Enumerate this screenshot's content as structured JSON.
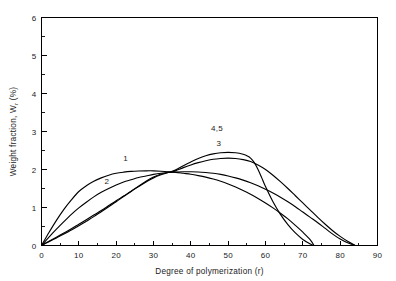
{
  "chart_data": {
    "type": "line",
    "title": "",
    "xlabel": "Degree of polymerization (r)",
    "ylabel_parts": {
      "main": "Weight fraction, W",
      "subscript": "r",
      "units": " (%)"
    },
    "ylabel": "Weight fraction, Wr (%)",
    "xlim": [
      0,
      90
    ],
    "ylim": [
      0,
      6
    ],
    "xticks": [
      0,
      10,
      20,
      30,
      40,
      50,
      60,
      70,
      80,
      90
    ],
    "xtick_labels": [
      "0",
      "10",
      "20",
      "30",
      "40",
      "50",
      "60",
      "70",
      "80",
      "90"
    ],
    "xminor_step": 5,
    "yticks": [
      0,
      1,
      2,
      3,
      4,
      5,
      6
    ],
    "ytick_labels": [
      "0",
      "1",
      "2",
      "3",
      "4",
      "5",
      "6"
    ],
    "yminor_step": 0.5,
    "grid": false,
    "legend_position": "inline-annotations",
    "line_color": "#000000",
    "background_color": "#ffffff",
    "annotations": [
      {
        "text": "1",
        "x": 22.5,
        "y": 2.22
      },
      {
        "text": "2",
        "x": 17.5,
        "y": 1.62
      },
      {
        "text": "3",
        "x": 47.5,
        "y": 2.62
      },
      {
        "text": "4,5",
        "x": 47.0,
        "y": 3.02
      }
    ],
    "series": [
      {
        "name": "1",
        "label": "1",
        "x": [
          0,
          2,
          4,
          6,
          8,
          10,
          12,
          14,
          16,
          18,
          20,
          22,
          24,
          26,
          28,
          30,
          32,
          34,
          35,
          36,
          38,
          40,
          42,
          44,
          46,
          48,
          50,
          52,
          54,
          56,
          58,
          60,
          62,
          64,
          66,
          68,
          70,
          72,
          73
        ],
        "y": [
          0,
          0.34,
          0.66,
          0.95,
          1.2,
          1.42,
          1.57,
          1.69,
          1.78,
          1.85,
          1.9,
          1.93,
          1.95,
          1.96,
          1.965,
          1.965,
          1.955,
          1.94,
          1.93,
          1.925,
          1.9,
          1.875,
          1.84,
          1.8,
          1.75,
          1.69,
          1.62,
          1.54,
          1.45,
          1.35,
          1.24,
          1.12,
          0.99,
          0.85,
          0.7,
          0.53,
          0.35,
          0.15,
          0.0
        ]
      },
      {
        "name": "2",
        "label": "2",
        "x": [
          0,
          2,
          4,
          6,
          8,
          10,
          12,
          14,
          16,
          18,
          20,
          22,
          24,
          26,
          28,
          30,
          32,
          34,
          35,
          36,
          38,
          40,
          42,
          44,
          46,
          48,
          50,
          52,
          54,
          56,
          58,
          60,
          62,
          64,
          66,
          68,
          70,
          72,
          74,
          76,
          78,
          80,
          82,
          84
        ],
        "y": [
          0,
          0.22,
          0.43,
          0.63,
          0.82,
          0.99,
          1.14,
          1.28,
          1.4,
          1.5,
          1.59,
          1.67,
          1.73,
          1.79,
          1.83,
          1.87,
          1.9,
          1.92,
          1.93,
          1.935,
          1.94,
          1.94,
          1.935,
          1.92,
          1.9,
          1.87,
          1.83,
          1.78,
          1.72,
          1.65,
          1.57,
          1.48,
          1.38,
          1.27,
          1.15,
          1.02,
          0.88,
          0.74,
          0.6,
          0.45,
          0.3,
          0.17,
          0.07,
          0.0
        ]
      },
      {
        "name": "3",
        "label": "3",
        "x": [
          0,
          2,
          4,
          6,
          8,
          10,
          12,
          14,
          16,
          18,
          20,
          22,
          24,
          26,
          28,
          30,
          32,
          34,
          35,
          36,
          38,
          40,
          42,
          44,
          46,
          48,
          50,
          52,
          54,
          56,
          58,
          60,
          62,
          64,
          66,
          68,
          70,
          72,
          74,
          76,
          78,
          80,
          82,
          84
        ],
        "y": [
          0,
          0.11,
          0.22,
          0.33,
          0.44,
          0.56,
          0.68,
          0.8,
          0.92,
          1.05,
          1.18,
          1.3,
          1.43,
          1.55,
          1.67,
          1.78,
          1.86,
          1.92,
          1.94,
          1.97,
          2.05,
          2.12,
          2.18,
          2.23,
          2.27,
          2.29,
          2.3,
          2.29,
          2.26,
          2.21,
          2.12,
          2.0,
          1.85,
          1.68,
          1.5,
          1.31,
          1.12,
          0.93,
          0.74,
          0.56,
          0.39,
          0.24,
          0.11,
          0.0
        ]
      },
      {
        "name": "4,5",
        "label": "4,5",
        "x": [
          0,
          2,
          4,
          6,
          8,
          10,
          12,
          14,
          16,
          18,
          20,
          22,
          24,
          26,
          28,
          30,
          32,
          34,
          35,
          36,
          38,
          40,
          42,
          44,
          46,
          48,
          50,
          52,
          54,
          55,
          56,
          57,
          58,
          59,
          60,
          62,
          64,
          66,
          68,
          70,
          72,
          73
        ],
        "y": [
          0,
          0.1,
          0.2,
          0.3,
          0.41,
          0.52,
          0.64,
          0.76,
          0.89,
          1.02,
          1.15,
          1.29,
          1.42,
          1.56,
          1.69,
          1.8,
          1.88,
          1.93,
          1.95,
          1.99,
          2.1,
          2.2,
          2.29,
          2.36,
          2.41,
          2.44,
          2.45,
          2.44,
          2.4,
          2.36,
          2.3,
          2.18,
          2.0,
          1.78,
          1.55,
          1.15,
          0.82,
          0.55,
          0.33,
          0.16,
          0.04,
          0.0
        ]
      }
    ]
  }
}
